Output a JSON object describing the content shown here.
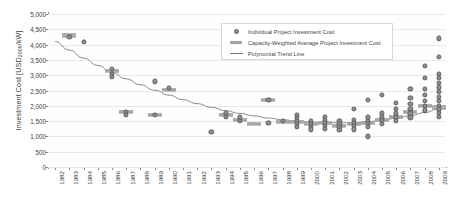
{
  "chart_data": {
    "type": "scatter",
    "title": "",
    "xlabel": "",
    "ylabel": "Investment Cost [USD2009/kW]",
    "ylabel_main": "Investment Cost [USD",
    "ylabel_sub": "2009",
    "ylabel_tail": "/kW]",
    "ylim": [
      0,
      5000
    ],
    "ytick_step": 500,
    "yticks": [
      "0",
      "500",
      "1,000",
      "1,500",
      "2,000",
      "2,500",
      "3,000",
      "3,500",
      "4,000",
      "4,500",
      "5,000"
    ],
    "ytick_values": [
      0,
      500,
      1000,
      1500,
      2000,
      2500,
      3000,
      3500,
      4000,
      4500,
      5000
    ],
    "xlim": [
      1982,
      2009
    ],
    "categories": [
      "1982",
      "1983",
      "1984",
      "1985",
      "1986",
      "1987",
      "1988",
      "1989",
      "1990",
      "1991",
      "1992",
      "1993",
      "1994",
      "1995",
      "1996",
      "1997",
      "1998",
      "1999",
      "2000",
      "2001",
      "2002",
      "2003",
      "2004",
      "2005",
      "2006",
      "2007",
      "2008",
      "2009"
    ],
    "grid": true,
    "legend_position": "top-center",
    "legend": [
      {
        "label": "Individual Project Investment Cost",
        "marker": "circle"
      },
      {
        "label": "Capacity-Weighted Average Project Investment Cost",
        "marker": "dash"
      },
      {
        "label": "Polynomial Trend Line",
        "marker": "line"
      }
    ],
    "series": [
      {
        "name": "Individual Project Investment Cost",
        "marker": "circle",
        "color": "#8f8f8f",
        "points": [
          {
            "x": 1983,
            "y": 4250
          },
          {
            "x": 1984,
            "y": 4100
          },
          {
            "x": 1986,
            "y": 3200
          },
          {
            "x": 1986,
            "y": 3050
          },
          {
            "x": 1986,
            "y": 2950
          },
          {
            "x": 1989,
            "y": 2800
          },
          {
            "x": 1990,
            "y": 2580
          },
          {
            "x": 1987,
            "y": 1800
          },
          {
            "x": 1987,
            "y": 1700
          },
          {
            "x": 1989,
            "y": 1700
          },
          {
            "x": 1994,
            "y": 1750
          },
          {
            "x": 1994,
            "y": 1650
          },
          {
            "x": 1995,
            "y": 1620
          },
          {
            "x": 1995,
            "y": 1500
          },
          {
            "x": 1993,
            "y": 1150
          },
          {
            "x": 1997,
            "y": 2200
          },
          {
            "x": 1997,
            "y": 1450
          },
          {
            "x": 1998,
            "y": 1500
          },
          {
            "x": 1999,
            "y": 1700
          },
          {
            "x": 1999,
            "y": 1600
          },
          {
            "x": 1999,
            "y": 1500
          },
          {
            "x": 1999,
            "y": 1420
          },
          {
            "x": 1999,
            "y": 1320
          },
          {
            "x": 2000,
            "y": 1500
          },
          {
            "x": 2000,
            "y": 1420
          },
          {
            "x": 2000,
            "y": 1320
          },
          {
            "x": 2000,
            "y": 1230
          },
          {
            "x": 2001,
            "y": 1650
          },
          {
            "x": 2001,
            "y": 1520
          },
          {
            "x": 2001,
            "y": 1430
          },
          {
            "x": 2001,
            "y": 1350
          },
          {
            "x": 2001,
            "y": 1250
          },
          {
            "x": 2002,
            "y": 1500
          },
          {
            "x": 2002,
            "y": 1400
          },
          {
            "x": 2002,
            "y": 1300
          },
          {
            "x": 2002,
            "y": 1200
          },
          {
            "x": 2003,
            "y": 1900
          },
          {
            "x": 2003,
            "y": 1550
          },
          {
            "x": 2003,
            "y": 1430
          },
          {
            "x": 2003,
            "y": 1330
          },
          {
            "x": 2003,
            "y": 1230
          },
          {
            "x": 2004,
            "y": 2200
          },
          {
            "x": 2004,
            "y": 1620
          },
          {
            "x": 2004,
            "y": 1500
          },
          {
            "x": 2004,
            "y": 1400
          },
          {
            "x": 2004,
            "y": 1300
          },
          {
            "x": 2004,
            "y": 1000
          },
          {
            "x": 2005,
            "y": 2350
          },
          {
            "x": 2005,
            "y": 1750
          },
          {
            "x": 2005,
            "y": 1620
          },
          {
            "x": 2005,
            "y": 1520
          },
          {
            "x": 2005,
            "y": 1420
          },
          {
            "x": 2006,
            "y": 2100
          },
          {
            "x": 2006,
            "y": 1900
          },
          {
            "x": 2006,
            "y": 1750
          },
          {
            "x": 2006,
            "y": 1620
          },
          {
            "x": 2006,
            "y": 1500
          },
          {
            "x": 2007,
            "y": 2550
          },
          {
            "x": 2007,
            "y": 2250
          },
          {
            "x": 2007,
            "y": 2050
          },
          {
            "x": 2007,
            "y": 1900
          },
          {
            "x": 2007,
            "y": 1750
          },
          {
            "x": 2007,
            "y": 1620
          },
          {
            "x": 2008,
            "y": 3300
          },
          {
            "x": 2008,
            "y": 2900
          },
          {
            "x": 2008,
            "y": 2550
          },
          {
            "x": 2008,
            "y": 2350
          },
          {
            "x": 2008,
            "y": 2150
          },
          {
            "x": 2008,
            "y": 2000
          },
          {
            "x": 2008,
            "y": 1850
          },
          {
            "x": 2009,
            "y": 4200
          },
          {
            "x": 2009,
            "y": 3600
          },
          {
            "x": 2009,
            "y": 3050
          },
          {
            "x": 2009,
            "y": 2900
          },
          {
            "x": 2009,
            "y": 2750
          },
          {
            "x": 2009,
            "y": 2600
          },
          {
            "x": 2009,
            "y": 2450
          },
          {
            "x": 2009,
            "y": 2300
          },
          {
            "x": 2009,
            "y": 2150
          },
          {
            "x": 2009,
            "y": 2000
          },
          {
            "x": 2009,
            "y": 1880
          },
          {
            "x": 2009,
            "y": 1760
          },
          {
            "x": 2009,
            "y": 1650
          }
        ]
      },
      {
        "name": "Capacity-Weighted Average Project Investment Cost",
        "marker": "dash",
        "color": "#b4b4b4",
        "points": [
          {
            "x": 1983,
            "y": 4300
          },
          {
            "x": 1986,
            "y": 3150
          },
          {
            "x": 1987,
            "y": 1800
          },
          {
            "x": 1989,
            "y": 1700
          },
          {
            "x": 1990,
            "y": 2520
          },
          {
            "x": 1994,
            "y": 1700
          },
          {
            "x": 1995,
            "y": 1540
          },
          {
            "x": 1996,
            "y": 1420
          },
          {
            "x": 1997,
            "y": 2180
          },
          {
            "x": 1998,
            "y": 1480
          },
          {
            "x": 1999,
            "y": 1480
          },
          {
            "x": 2000,
            "y": 1400
          },
          {
            "x": 2001,
            "y": 1450
          },
          {
            "x": 2002,
            "y": 1350
          },
          {
            "x": 2003,
            "y": 1400
          },
          {
            "x": 2004,
            "y": 1450
          },
          {
            "x": 2005,
            "y": 1550
          },
          {
            "x": 2006,
            "y": 1650
          },
          {
            "x": 2007,
            "y": 1800
          },
          {
            "x": 2008,
            "y": 2000
          },
          {
            "x": 2009,
            "y": 1950
          }
        ]
      },
      {
        "name": "Polynomial Trend Line",
        "marker": "line",
        "color": "#7a7a7a",
        "points": [
          {
            "x": 1982,
            "y": 4100
          },
          {
            "x": 1983,
            "y": 3820
          },
          {
            "x": 1984,
            "y": 3560
          },
          {
            "x": 1985,
            "y": 3320
          },
          {
            "x": 1986,
            "y": 3090
          },
          {
            "x": 1987,
            "y": 2880
          },
          {
            "x": 1988,
            "y": 2690
          },
          {
            "x": 1989,
            "y": 2510
          },
          {
            "x": 1990,
            "y": 2350
          },
          {
            "x": 1991,
            "y": 2200
          },
          {
            "x": 1992,
            "y": 2070
          },
          {
            "x": 1993,
            "y": 1950
          },
          {
            "x": 1994,
            "y": 1840
          },
          {
            "x": 1995,
            "y": 1750
          },
          {
            "x": 1996,
            "y": 1670
          },
          {
            "x": 1997,
            "y": 1600
          },
          {
            "x": 1998,
            "y": 1545
          },
          {
            "x": 1999,
            "y": 1500
          },
          {
            "x": 2000,
            "y": 1470
          },
          {
            "x": 2001,
            "y": 1450
          },
          {
            "x": 2002,
            "y": 1445
          },
          {
            "x": 2003,
            "y": 1455
          },
          {
            "x": 2004,
            "y": 1480
          },
          {
            "x": 2005,
            "y": 1525
          },
          {
            "x": 2006,
            "y": 1590
          },
          {
            "x": 2007,
            "y": 1675
          },
          {
            "x": 2008,
            "y": 1780
          },
          {
            "x": 2009,
            "y": 1900
          }
        ]
      }
    ]
  }
}
